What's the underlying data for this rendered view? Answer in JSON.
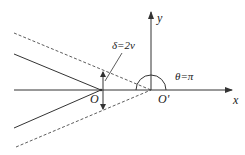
{
  "diagram": {
    "labels": {
      "y_axis": "y",
      "x_axis": "x",
      "origin": "O",
      "origin_prime": "O'",
      "delta": "δ=2v",
      "theta": "θ=π"
    },
    "colors": {
      "line": "#333333",
      "background": "#ffffff"
    },
    "elements": [
      {
        "type": "axis",
        "name": "x-axis",
        "from": [
          14,
          90
        ],
        "to": [
          232,
          90
        ],
        "arrow": true
      },
      {
        "type": "axis",
        "name": "y-axis",
        "from": [
          151,
          90
        ],
        "to": [
          151,
          12
        ],
        "arrow": true
      },
      {
        "type": "solid-line",
        "name": "upper-crack-face",
        "from": [
          14,
          54
        ],
        "to": [
          101,
          90
        ]
      },
      {
        "type": "solid-line",
        "name": "lower-crack-face",
        "from": [
          14,
          128
        ],
        "to": [
          101,
          90
        ]
      },
      {
        "type": "dashed-line",
        "name": "upper-dashed-line",
        "from": [
          14,
          33
        ],
        "to": [
          151,
          90
        ]
      },
      {
        "type": "dashed-line",
        "name": "lower-dashed-line",
        "from": [
          16,
          147
        ],
        "to": [
          151,
          90
        ]
      },
      {
        "type": "arc",
        "name": "theta-arc",
        "center": [
          151,
          90
        ],
        "radius": 15,
        "angle": "π"
      }
    ]
  }
}
